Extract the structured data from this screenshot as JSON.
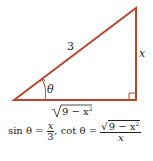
{
  "diagram": {
    "type": "right-triangle",
    "color": "#b5472e",
    "hypotenuse_label": "3",
    "opposite_label": "x",
    "adjacent_label": "9 − x",
    "adjacent_exp": "2",
    "angle_label": "θ",
    "right_angle_marker": true
  },
  "formula": {
    "sin_text": "sin θ =",
    "sin_num": "x",
    "sin_den": "3",
    "sep": ",",
    "cot_text": "cot θ =",
    "cot_num_rad": "9 − x",
    "cot_num_exp": "2",
    "cot_den": "x"
  }
}
